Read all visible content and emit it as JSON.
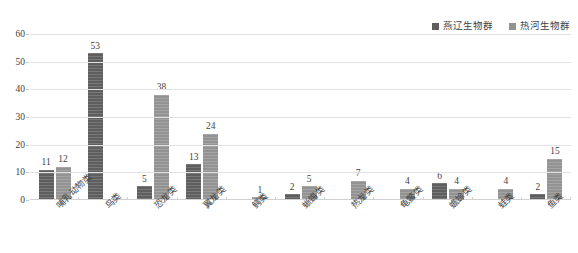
{
  "chart_data": {
    "type": "bar",
    "title": "",
    "xlabel": "",
    "ylabel": "",
    "ylim": [
      0,
      60
    ],
    "yticks": [
      0,
      10,
      20,
      30,
      40,
      50,
      60
    ],
    "grid": true,
    "legend_position": "top-right",
    "categories": [
      "哺乳动物类",
      "鸟类",
      "恐龙类",
      "翼龙类",
      "鳄类",
      "蜥蜴类",
      "热龙类",
      "龟鳖类",
      "蟾蜍类",
      "蛙类",
      "鱼类"
    ],
    "series": [
      {
        "name": "燕辽生物群",
        "color": "#5e5e5e",
        "values": [
          11,
          53,
          5,
          13,
          null,
          2,
          null,
          null,
          6,
          null,
          2
        ]
      },
      {
        "name": "热河生物群",
        "color": "#939393",
        "values": [
          12,
          null,
          38,
          24,
          1,
          5,
          7,
          4,
          4,
          4,
          15
        ]
      }
    ]
  },
  "legend": {
    "entries": [
      {
        "label": "燕辽生物群",
        "color": "#5e5e5e"
      },
      {
        "label": "热河生物群",
        "color": "#939393"
      }
    ]
  },
  "axis": {
    "y_tick_labels": [
      "60",
      "50",
      "40",
      "30",
      "20",
      "10",
      "0"
    ]
  }
}
